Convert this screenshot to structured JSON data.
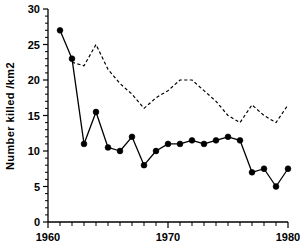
{
  "chart_data": {
    "type": "line",
    "title": "",
    "xlabel": "",
    "ylabel": "Number killed /km2",
    "xlim": [
      1960,
      1980
    ],
    "ylim": [
      0,
      30
    ],
    "grid": false,
    "legend": "none",
    "x_ticks_major": [
      1960,
      1970,
      1980
    ],
    "x_tick_labels": [
      "1960",
      "1970",
      "1980"
    ],
    "x_ticks_minor": [
      1961,
      1962,
      1963,
      1964,
      1965,
      1966,
      1967,
      1968,
      1969,
      1971,
      1972,
      1973,
      1974,
      1975,
      1976,
      1977,
      1978,
      1979
    ],
    "y_ticks_major": [
      0,
      5,
      10,
      15,
      20,
      25,
      30
    ],
    "y_tick_labels": [
      "0",
      "5",
      "10",
      "15",
      "20",
      "25",
      "30"
    ],
    "y_ticks_minor": [
      1,
      2,
      3,
      4,
      6,
      7,
      8,
      9,
      11,
      12,
      13,
      14,
      16,
      17,
      18,
      19,
      21,
      22,
      23,
      24,
      26,
      27,
      28,
      29
    ],
    "series": [
      {
        "name": "solid-with-markers",
        "style": "solid",
        "markers": "filled-circle",
        "color": "#000000",
        "x": [
          1961,
          1962,
          1963,
          1964,
          1965,
          1966,
          1967,
          1968,
          1969,
          1970,
          1971,
          1972,
          1973,
          1974,
          1975,
          1976,
          1977,
          1978,
          1979,
          1980
        ],
        "values": [
          27,
          23,
          11,
          15.5,
          10.5,
          10,
          12,
          8,
          10,
          11,
          11,
          11.5,
          11,
          11.5,
          12,
          11.5,
          7,
          7.5,
          5,
          7.5
        ]
      },
      {
        "name": "dashed-no-markers",
        "style": "dashed",
        "markers": "none",
        "color": "#000000",
        "x": [
          1962,
          1963,
          1964,
          1965,
          1966,
          1967,
          1968,
          1969,
          1970,
          1971,
          1972,
          1973,
          1974,
          1975,
          1976,
          1977,
          1978,
          1979,
          1980
        ],
        "values": [
          22.5,
          22,
          25,
          21.5,
          19.5,
          18,
          16,
          17.5,
          18.5,
          20,
          20,
          18.5,
          17,
          15,
          14,
          16.5,
          15,
          14,
          16.5
        ]
      }
    ]
  },
  "axes": {
    "y_axis_title": "Number killed /km2"
  }
}
